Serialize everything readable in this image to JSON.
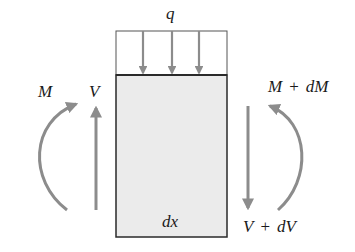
{
  "diagram": {
    "labels": {
      "distributed_load": "q",
      "moment_left": "M",
      "shear_left": "V",
      "moment_right_main": "M",
      "moment_right_op": "+",
      "moment_right_delta": "dM",
      "shear_right_main": "V",
      "shear_right_op": "+",
      "shear_right_delta": "dV",
      "length": "dx"
    },
    "colors": {
      "arrow": "#8c8c8c",
      "outline": "#2a2a2a",
      "element_fill": "#ebebeb",
      "text": "#1a1a1a"
    },
    "load_arrows": 3
  }
}
